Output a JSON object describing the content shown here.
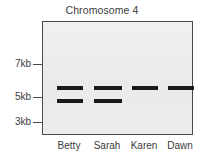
{
  "chart_data": {
    "type": "table",
    "title": "Chromosome 4",
    "subtitle": "",
    "xlabel": "",
    "ylabel": "",
    "plot_kind": "gel-electrophoresis",
    "grid": false,
    "legend": "none",
    "y_axis": {
      "ticks": [
        {
          "label": "7kb",
          "value": 7,
          "y_px": 64
        },
        {
          "label": "5kb",
          "value": 5,
          "y_px": 97
        },
        {
          "label": "3kb",
          "value": 3,
          "y_px": 122
        }
      ],
      "ylim": [
        2,
        8
      ],
      "unit": "kb",
      "direction": "decreasing-downward"
    },
    "categories": [
      "Betty",
      "Sarah",
      "Karen",
      "Dawn"
    ],
    "lanes": [
      {
        "name": "Betty",
        "label_x_px": 20,
        "lane_left_px": 12,
        "lane_width_px": 30,
        "band_count": 2,
        "bands": [
          {
            "size_kb": 6.0,
            "y_px": 85,
            "left_px": 14,
            "width_px": 26
          },
          {
            "size_kb": 5.0,
            "y_px": 98,
            "left_px": 14,
            "width_px": 26
          }
        ]
      },
      {
        "name": "Sarah",
        "label_x_px": 58,
        "lane_left_px": 49,
        "lane_width_px": 32,
        "band_count": 2,
        "bands": [
          {
            "size_kb": 6.0,
            "y_px": 85,
            "left_px": 51,
            "width_px": 28
          },
          {
            "size_kb": 5.0,
            "y_px": 98,
            "left_px": 51,
            "width_px": 28
          }
        ]
      },
      {
        "name": "Karen",
        "label_x_px": 96,
        "lane_left_px": 87,
        "lane_width_px": 30,
        "band_count": 1,
        "bands": [
          {
            "size_kb": 6.0,
            "y_px": 85,
            "left_px": 89,
            "width_px": 26
          }
        ]
      },
      {
        "name": "Dawn",
        "label_x_px": 132,
        "lane_left_px": 124,
        "lane_width_px": 28,
        "band_count": 1,
        "bands": [
          {
            "size_kb": 6.0,
            "y_px": 85,
            "left_px": 125,
            "width_px": 26
          }
        ]
      }
    ],
    "colors": {
      "band": "#181818",
      "gel_background": "#ededed",
      "plate_border": "#4a4a4a",
      "text": "#3b3b3b",
      "page_background": "#ffffff"
    }
  }
}
